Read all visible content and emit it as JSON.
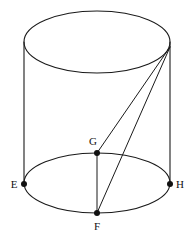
{
  "figure": {
    "shape": "cylinder",
    "stroke_color": "#1a1a1a",
    "background_color": "#ffffff",
    "label_color": "#111111",
    "canvas": {
      "width": 192,
      "height": 238
    },
    "top_ellipse": {
      "cx": 97,
      "cy": 42,
      "rx": 73,
      "ry": 31
    },
    "bottom_ellipse": {
      "cx": 97,
      "cy": 183,
      "rx": 73,
      "ry": 30
    },
    "side_lines": [
      {
        "name": "left-side",
        "x1": 24,
        "y1": 42,
        "x2": 24,
        "y2": 183
      },
      {
        "name": "right-side",
        "x1": 170,
        "y1": 42,
        "x2": 170,
        "y2": 183
      }
    ],
    "apex": {
      "x": 170,
      "y": 47
    },
    "points": [
      {
        "id": "E",
        "label": "E",
        "x": 24,
        "y": 184,
        "label_x": 14,
        "label_y": 188
      },
      {
        "id": "F",
        "label": "F",
        "x": 97,
        "y": 213,
        "label_x": 97,
        "label_y": 230
      },
      {
        "id": "G",
        "label": "G",
        "x": 97,
        "y": 153,
        "label_x": 93,
        "label_y": 145
      },
      {
        "id": "H",
        "label": "H",
        "x": 170,
        "y": 184,
        "label_x": 180,
        "label_y": 188
      }
    ],
    "segments": [
      {
        "name": "apex-to-G",
        "from": "apex",
        "to": "G"
      },
      {
        "name": "apex-to-F",
        "from": "apex",
        "to": "F"
      },
      {
        "name": "G-to-F",
        "from": "G",
        "to": "F"
      }
    ]
  }
}
